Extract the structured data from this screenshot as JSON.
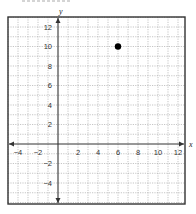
{
  "chart_data": {
    "type": "scatter",
    "title": "",
    "xlabel": "x",
    "ylabel": "y",
    "xlim": [
      -5,
      12.7
    ],
    "ylim": [
      -6.2,
      13
    ],
    "grid": true,
    "grid_step": 1,
    "x_ticks": [
      -4,
      -2,
      2,
      4,
      6,
      8,
      10,
      12
    ],
    "x_tick_labels": [
      "−4",
      "−2",
      "2",
      "4",
      "6",
      "8",
      "10",
      "12"
    ],
    "y_ticks": [
      12,
      10,
      8,
      6,
      4,
      2,
      -2,
      -4
    ],
    "y_tick_labels": [
      "12",
      "10",
      "8",
      "6",
      "4",
      "2",
      "−2",
      "−4"
    ],
    "series": [
      {
        "name": "point",
        "x": [
          6
        ],
        "y": [
          10
        ]
      }
    ],
    "legend": null
  },
  "layout": {
    "origin_px": [
      58,
      144
    ],
    "px_per_x": 10,
    "px_per_y": 9.75,
    "frame": {
      "left": 8,
      "top": 17,
      "right": 185,
      "bottom": 204
    },
    "colors": {
      "frame": "#333333",
      "axis": "#333333",
      "grid": "#a0a0a0",
      "point": "#000000"
    }
  }
}
